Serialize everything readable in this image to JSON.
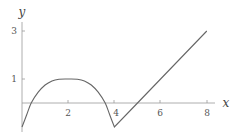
{
  "chart_data": {
    "type": "line",
    "title": "",
    "xlabel": "x",
    "ylabel": "y",
    "xlim": [
      0,
      8.5
    ],
    "ylim": [
      -1.1,
      3.4
    ],
    "x_ticks": [
      2,
      4,
      6,
      8
    ],
    "y_ticks": [
      1,
      3
    ],
    "grid": false,
    "legend": null,
    "series": [
      {
        "name": "f(x)",
        "description": "Smooth arch from (0,-1) rising to a plateau at y=1 near x=2, falling to a corner at (4,-1), then a straight line up to (8,3)",
        "points": [
          [
            0,
            -1
          ],
          [
            0.2,
            -0.5
          ],
          [
            0.4,
            0
          ],
          [
            0.7,
            0.45
          ],
          [
            1.0,
            0.75
          ],
          [
            1.3,
            0.92
          ],
          [
            1.6,
            0.99
          ],
          [
            2.0,
            1.0
          ],
          [
            2.4,
            0.99
          ],
          [
            2.7,
            0.92
          ],
          [
            3.0,
            0.75
          ],
          [
            3.3,
            0.45
          ],
          [
            3.6,
            0
          ],
          [
            3.8,
            -0.5
          ],
          [
            4.0,
            -1
          ],
          [
            5.0,
            0
          ],
          [
            6.0,
            1
          ],
          [
            7.0,
            2
          ],
          [
            8.0,
            3
          ]
        ]
      }
    ],
    "color": "#666666"
  },
  "labels": {
    "x_axis": "x",
    "y_axis": "y",
    "x_ticks": [
      "2",
      "4",
      "6",
      "8"
    ],
    "y_ticks": [
      "1",
      "3"
    ]
  }
}
